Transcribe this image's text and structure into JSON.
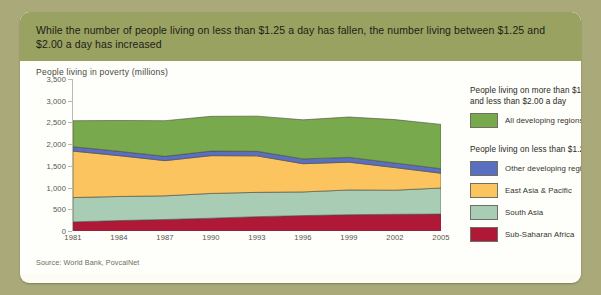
{
  "header": {
    "text": "While the number of people living on less than $1.25 a day has fallen, the number living between $1.25 and $2.00 a day has increased",
    "background": "#9aa262"
  },
  "chart_title": "People living in poverty (millions)",
  "source": "Source: World Bank, PovcalNet",
  "legend": {
    "groups": [
      {
        "heading": "People living on more than $1.25 a day, and less than $2.00 a day",
        "items": [
          {
            "label": "All developing regions",
            "color": "#79a94d"
          }
        ]
      },
      {
        "heading": "People living on less than $1.25 a day",
        "items": [
          {
            "label": "Other developing regions",
            "color": "#5b6fc0"
          },
          {
            "label": "East Asia & Pacific",
            "color": "#fbc45f"
          },
          {
            "label": "South Asia",
            "color": "#a8cdb4"
          },
          {
            "label": "Sub-Saharan Africa",
            "color": "#b01838"
          }
        ]
      }
    ]
  },
  "chart_data": {
    "type": "area",
    "stacked": true,
    "title": "People living in poverty (millions)",
    "xlabel": "",
    "ylabel": "People living in poverty (millions)",
    "grid": false,
    "legend_position": "right",
    "x": [
      1981,
      1984,
      1987,
      1990,
      1993,
      1996,
      1999,
      2002,
      2005
    ],
    "xticks": [
      "1981",
      "1984",
      "1987",
      "1990",
      "1993",
      "1996",
      "1999",
      "2002",
      "2005"
    ],
    "yticks": [
      0,
      500,
      1000,
      1500,
      2000,
      2500,
      3000,
      3500
    ],
    "ytick_labels": [
      "0",
      "500",
      "1,000",
      "1,500",
      "2,000",
      "2,500",
      "3,000",
      "3,500"
    ],
    "ylim": [
      0,
      3500
    ],
    "series": [
      {
        "name": "Sub-Saharan Africa",
        "color": "#b01838",
        "values": [
          210,
          240,
          265,
          295,
          330,
          355,
          375,
          385,
          390
        ]
      },
      {
        "name": "South Asia",
        "color": "#a8cdb4",
        "values": [
          560,
          555,
          545,
          570,
          560,
          545,
          570,
          555,
          600
        ]
      },
      {
        "name": "East Asia & Pacific",
        "color": "#fbc45f",
        "values": [
          1070,
          940,
          810,
          870,
          840,
          650,
          640,
          520,
          340
        ]
      },
      {
        "name": "Other developing regions",
        "color": "#5b6fc0",
        "values": [
          100,
          100,
          100,
          105,
          105,
          110,
          110,
          105,
          105
        ]
      },
      {
        "name": "All developing regions",
        "color": "#79a94d",
        "values": [
          600,
          710,
          820,
          800,
          810,
          900,
          930,
          1000,
          1020
        ]
      }
    ],
    "totals": [
      2540,
      2545,
      2540,
      2640,
      2645,
      2560,
      2625,
      2565,
      2455
    ]
  }
}
